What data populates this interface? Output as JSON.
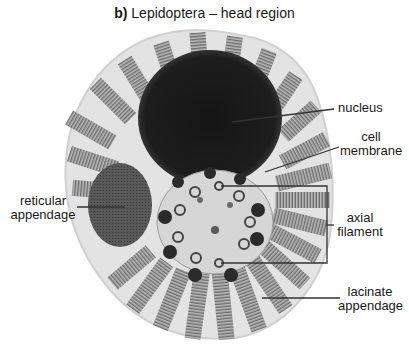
{
  "title": {
    "prefix": "b)",
    "text": "Lepidoptera – head region"
  },
  "labels": {
    "nucleus": "nucleus",
    "cell_membrane_1": "cell",
    "cell_membrane_2": "membrane",
    "reticular_1": "reticular",
    "reticular_2": "appendage",
    "axial_1": "axial",
    "axial_2": "filament",
    "lacinate_1": "lacinate",
    "lacinate_2": "appendage"
  },
  "colors": {
    "background": "#ffffff",
    "cell_fill": "#e4e4e4",
    "lamella": "#8a8a8a",
    "nucleus": "#1c1c1c",
    "reticular": "#555555",
    "leader_line": "#333333"
  }
}
